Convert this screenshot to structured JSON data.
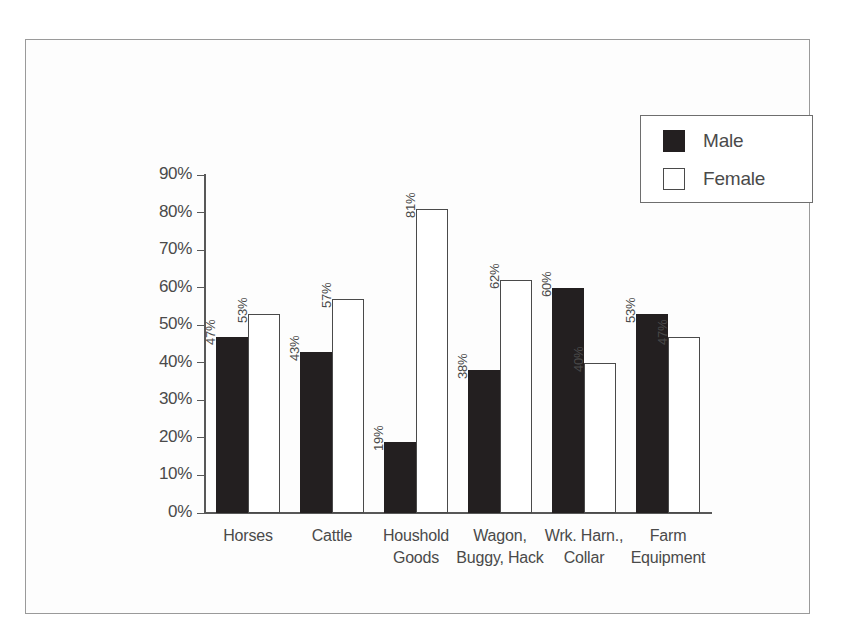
{
  "chart_data": {
    "type": "bar",
    "title": "",
    "xlabel": "",
    "ylabel": "",
    "ylim": [
      0,
      90
    ],
    "grid": false,
    "legend_position": "top-right",
    "categories": [
      "Horses",
      "Cattle",
      "Houshold\nGoods",
      "Wagon,\nBuggy, Hack",
      "Wrk. Harn.,\nCollar",
      "Farm\nEquipment"
    ],
    "ytick_labels": [
      "0%",
      "10%",
      "20%",
      "30%",
      "40%",
      "50%",
      "60%",
      "70%",
      "80%",
      "90%"
    ],
    "ytick_values": [
      0,
      10,
      20,
      30,
      40,
      50,
      60,
      70,
      80,
      90
    ],
    "series": [
      {
        "name": "Male",
        "color": "#231f20",
        "values": [
          47,
          43,
          19,
          38,
          60,
          53
        ],
        "value_labels": [
          "47%",
          "43%",
          "19%",
          "38%",
          "60%",
          "53%"
        ]
      },
      {
        "name": "Female",
        "color": "#ffffff",
        "values": [
          53,
          57,
          81,
          62,
          40,
          47
        ],
        "value_labels": [
          "53%",
          "57%",
          "81%",
          "62%",
          "40%",
          "47%"
        ]
      }
    ]
  },
  "legend": {
    "items": [
      {
        "label": "Male",
        "swatch": "male"
      },
      {
        "label": "Female",
        "swatch": "female"
      }
    ]
  },
  "caption_ghost": ""
}
